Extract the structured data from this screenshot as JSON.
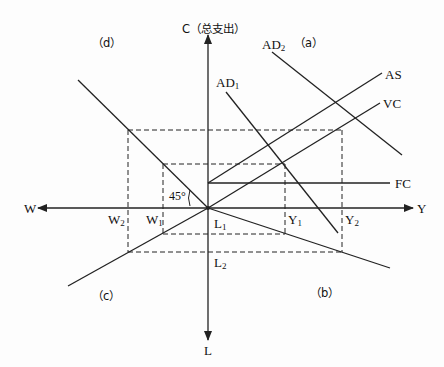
{
  "diagram": {
    "axes": {
      "up": "C（总支出）",
      "right": "Y",
      "left": "W",
      "down": "L"
    },
    "quadrants": {
      "a": "（a）",
      "b": "（b）",
      "c": "（c）",
      "d": "（d）"
    },
    "curves": {
      "ad1": {
        "base": "AD",
        "sub": "1"
      },
      "ad2": {
        "base": "AD",
        "sub": "2"
      },
      "as": "AS",
      "vc": "VC",
      "fc": "FC"
    },
    "angle_label": "45°",
    "markers": {
      "y1": {
        "base": "Y",
        "sub": "1"
      },
      "y2": {
        "base": "Y",
        "sub": "2"
      },
      "w1": {
        "base": "W",
        "sub": "1"
      },
      "w2": {
        "base": "W",
        "sub": "2"
      },
      "l1": {
        "base": "L",
        "sub": "1"
      },
      "l2": {
        "base": "L",
        "sub": "2"
      }
    },
    "colors": {
      "line": "#222222",
      "background": "#fdfdfd"
    }
  }
}
